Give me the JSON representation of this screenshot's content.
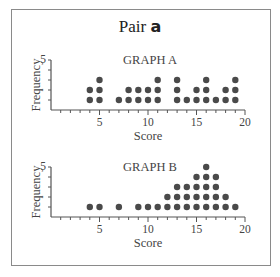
{
  "title": {
    "prefix": "Pair",
    "letter": "a"
  },
  "colors": {
    "dot": "#4a4a4a",
    "axis": "#555555",
    "frame": "#8a8a8a"
  },
  "chart_data": [
    {
      "type": "scatter",
      "subtype": "dot_plot",
      "title": "GRAPH A",
      "xlabel": "Score",
      "ylabel": "Frequency",
      "xlim": [
        0,
        20
      ],
      "ylim": [
        0,
        5
      ],
      "xticks": [
        5,
        10,
        15,
        20
      ],
      "yticks": [
        5
      ],
      "grid": false,
      "x": [
        4,
        5,
        7,
        8,
        9,
        10,
        11,
        13,
        14,
        15,
        16,
        17,
        18,
        19
      ],
      "values": [
        2,
        3,
        1,
        2,
        2,
        2,
        3,
        3,
        1,
        2,
        3,
        1,
        2,
        3
      ]
    },
    {
      "type": "scatter",
      "subtype": "dot_plot",
      "title": "GRAPH B",
      "xlabel": "Score",
      "ylabel": "Frequency",
      "xlim": [
        0,
        20
      ],
      "ylim": [
        0,
        5
      ],
      "xticks": [
        5,
        10,
        15,
        20
      ],
      "yticks": [
        5
      ],
      "grid": false,
      "x": [
        4,
        5,
        7,
        9,
        10,
        11,
        12,
        13,
        14,
        15,
        16,
        17,
        18,
        19
      ],
      "values": [
        1,
        1,
        1,
        1,
        1,
        1,
        2,
        3,
        3,
        4,
        5,
        4,
        2,
        1
      ]
    }
  ]
}
